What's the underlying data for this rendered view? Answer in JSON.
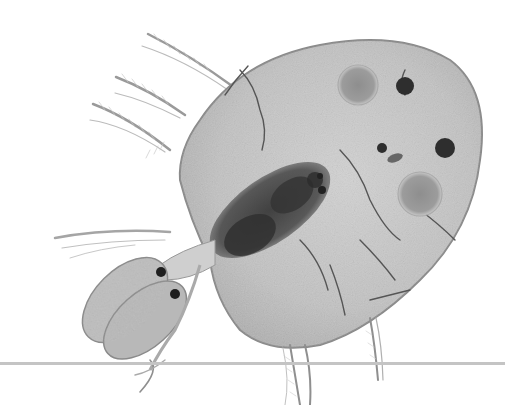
{
  "image": {
    "description": "Grayscale microscopy of a small crustacean with rounded carapace, feathery antennae, dark gut mass and several eggs/spots",
    "background_color": "#ffffff",
    "body_fill": "#bdbdbd",
    "body_outline": "#8a8a8a",
    "gut_color": "#3a3a3a",
    "egg_color": "#9a9a9a",
    "spot_color": "#2e2e2e",
    "line_color": "#c4c4c4"
  }
}
